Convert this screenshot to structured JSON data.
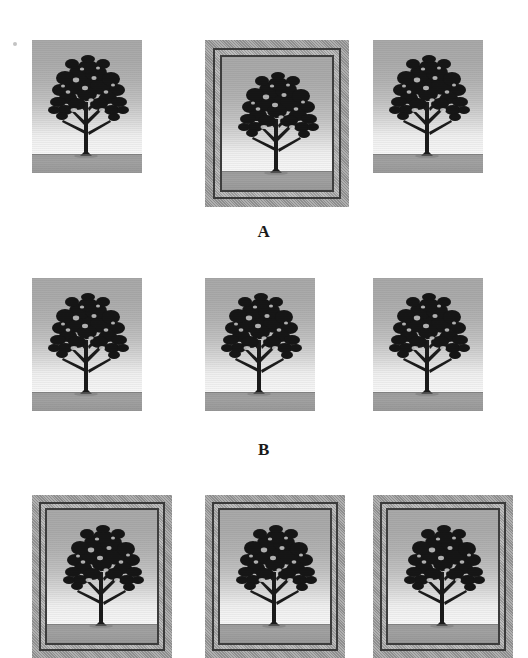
{
  "figure": {
    "background_color": "#ffffff",
    "width": 528,
    "height": 641,
    "artifact": {
      "name": "speck",
      "x": 13,
      "y": 42
    }
  },
  "palette": {
    "sky_top": "#a9a9a9",
    "sky_bottom": "#f7f7f7",
    "ground": "#9d9d9d",
    "tree": "#1b1b1b",
    "frame_outer": "#9e9e9e",
    "frame_line": "#3a3a3a",
    "label_text": "#1a1a1a"
  },
  "rows": [
    {
      "id": "a",
      "label": "A",
      "panels": [
        {
          "id": "a1",
          "framed": false,
          "alt": "tree photograph"
        },
        {
          "id": "a2",
          "framed": true,
          "alt": "tree photograph in frame"
        },
        {
          "id": "a3",
          "framed": false,
          "alt": "tree photograph"
        }
      ]
    },
    {
      "id": "b",
      "label": "B",
      "panels": [
        {
          "id": "b1",
          "framed": false,
          "alt": "tree photograph"
        },
        {
          "id": "b2",
          "framed": false,
          "alt": "tree photograph"
        },
        {
          "id": "b3",
          "framed": false,
          "alt": "tree photograph"
        }
      ]
    },
    {
      "id": "c",
      "label": "",
      "panels": [
        {
          "id": "c1",
          "framed": true,
          "alt": "tree photograph in frame"
        },
        {
          "id": "c2",
          "framed": true,
          "alt": "tree photograph in frame"
        },
        {
          "id": "c3",
          "framed": true,
          "alt": "tree photograph in frame"
        }
      ]
    }
  ]
}
